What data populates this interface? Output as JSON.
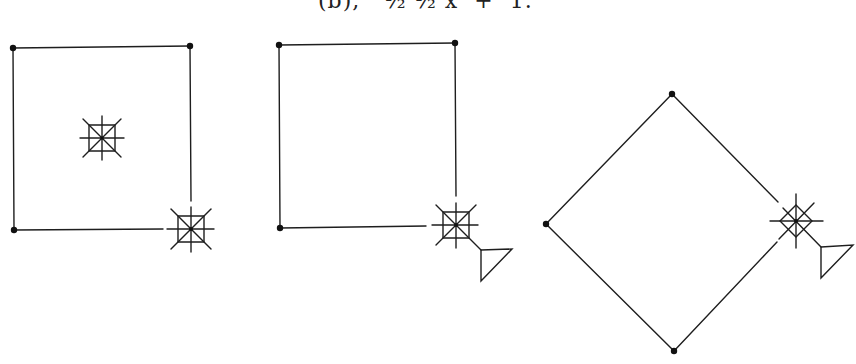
{
  "caption": {
    "text": "(b),   ½ ½ x  +  1."
  },
  "figures": [
    {
      "id": "figure-1",
      "shape": "square",
      "vertices": [
        [
          13,
          48
        ],
        [
          190,
          46
        ],
        [
          14,
          230
        ]
      ],
      "open_corner": [
        191,
        229
      ],
      "symbols": [
        {
          "type": "boxed-star",
          "center": [
            102,
            138
          ],
          "half": 13
        },
        {
          "type": "boxed-star",
          "center": [
            191,
            229
          ],
          "half": 13
        }
      ]
    },
    {
      "id": "figure-2",
      "shape": "square",
      "vertices": [
        [
          279,
          45
        ],
        [
          455,
          43
        ],
        [
          280,
          228
        ]
      ],
      "open_corner": [
        456,
        225
      ],
      "symbols": [
        {
          "type": "boxed-star",
          "center": [
            456,
            225
          ],
          "half": 13
        }
      ],
      "flag": {
        "type": "triangle",
        "points": [
          [
            481,
            250
          ],
          [
            512,
            249
          ],
          [
            481,
            281
          ]
        ]
      }
    },
    {
      "id": "figure-3",
      "shape": "diamond",
      "vertices": [
        [
          672,
          94
        ],
        [
          546,
          224
        ],
        [
          674,
          351
        ]
      ],
      "open_corner": [
        796,
        221
      ],
      "symbols": [
        {
          "type": "diamond-star",
          "center": [
            796,
            221
          ],
          "half": 16
        }
      ],
      "flag": {
        "type": "triangle",
        "points": [
          [
            821,
            247
          ],
          [
            853,
            245
          ],
          [
            821,
            278
          ]
        ]
      }
    }
  ]
}
